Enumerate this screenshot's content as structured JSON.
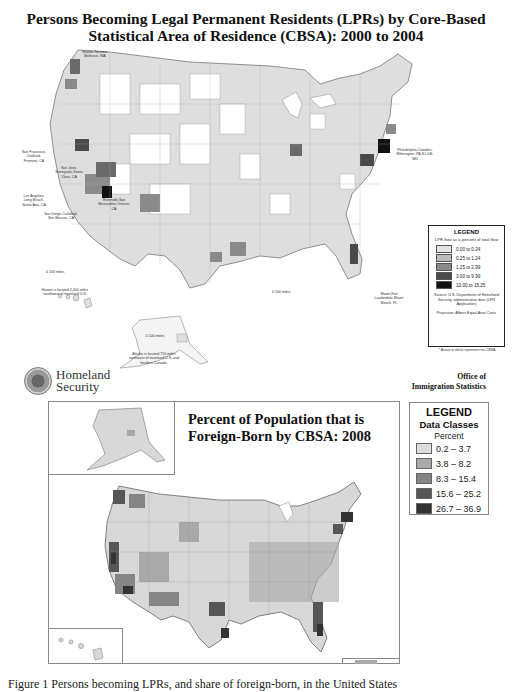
{
  "map1": {
    "title": "Persons Becoming Legal Permanent Residents (LPRs) by Core-Based Statistical Area of Residence (CBSA): 2000 to 2004",
    "city_labels": [
      "Seattle-Tacoma-Bellevue, WA",
      "San Francisco-Oakland-Fremont, CA",
      "San Jose-Sunnyvale-Santa Clara, CA",
      "Los Angeles-Long Beach-Santa Ana, CA",
      "Riverside-San Bernardino-Ontario, CA",
      "San Diego-Carlsbad-San Marcos, CA",
      "Philadelphia-Camden-Wilmington, PA-NJ-DE-MD",
      "Miami-Fort Lauderdale-Miami Beach, FL"
    ],
    "scale_conus": "0    100 miles",
    "scale_hawaii": "0    100 miles",
    "hawaii_note": "Hawaii is located 2,400 miles southwest of mainland U.S.",
    "scale_alaska": "0 100 miles",
    "alaska_note": "Alaska is located 750 miles northwest of mainland U.S. and borders Canada.",
    "legend": {
      "title": "LEGEND",
      "subtitle": "LPR flow as a percent of total flow",
      "classes": [
        {
          "label": "0.00 to 0.24",
          "color": "#e4e4e4"
        },
        {
          "label": "0.25 to 1.24",
          "color": "#bdbdbd"
        },
        {
          "label": "1.25 to 2.99",
          "color": "#8a8a8a"
        },
        {
          "label": "3.00 to 9.99",
          "color": "#4a4a4a"
        },
        {
          "label": "10.00 to 15.25",
          "color": "#111111"
        }
      ],
      "source": "Source: U.S. Department of Homeland Security, administrative data (LPR Application)",
      "projection": "Projection: Albers Equal Area Conic",
      "note": "* Areas in white represent no CBSA"
    }
  },
  "header": {
    "agency_line1": "Homeland",
    "agency_line2": "Security",
    "office_line1": "Office of",
    "office_line2": "Immigration Statistics"
  },
  "map2": {
    "title": "Percent of Population that is Foreign-Born by CBSA: 2008",
    "legend": {
      "title": "LEGEND",
      "subtitle": "Data Classes",
      "unit": "Percent",
      "classes": [
        {
          "label": "0.2 – 3.7",
          "color": "#dcdcdc"
        },
        {
          "label": "3.8 – 8.2",
          "color": "#a9a9a9"
        },
        {
          "label": "8.3 – 15.4",
          "color": "#858585"
        },
        {
          "label": "15.6 – 25.2",
          "color": "#565656"
        },
        {
          "label": "26.7 – 36.9",
          "color": "#333333"
        }
      ]
    }
  },
  "caption": "Figure 1 Persons becoming LPRs, and share of foreign-born, in the United States"
}
